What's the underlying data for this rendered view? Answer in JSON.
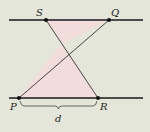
{
  "diagram": {
    "type": "geometry",
    "colors": {
      "background": "#e4e6da",
      "line": "#1a1a1a",
      "fill": "#f2dcdc",
      "point": "#111111"
    },
    "lines": [
      {
        "name": "top-line",
        "x1": 9,
        "y1": 20,
        "x2": 143,
        "y2": 20
      },
      {
        "name": "bottom-line",
        "x1": 9,
        "y1": 98,
        "x2": 143,
        "y2": 98
      }
    ],
    "points": {
      "S": {
        "label": "S",
        "x": 46,
        "y": 20
      },
      "Q": {
        "label": "Q",
        "x": 109,
        "y": 20
      },
      "P": {
        "label": "P",
        "x": 19,
        "y": 98
      },
      "R": {
        "label": "R",
        "x": 98,
        "y": 98
      }
    },
    "segments": [
      "SR",
      "PQ"
    ],
    "shaded_triangles": [
      "S-Q-X",
      "P-R-X"
    ],
    "brace": {
      "from": "P",
      "to": "R",
      "label": "d"
    }
  }
}
